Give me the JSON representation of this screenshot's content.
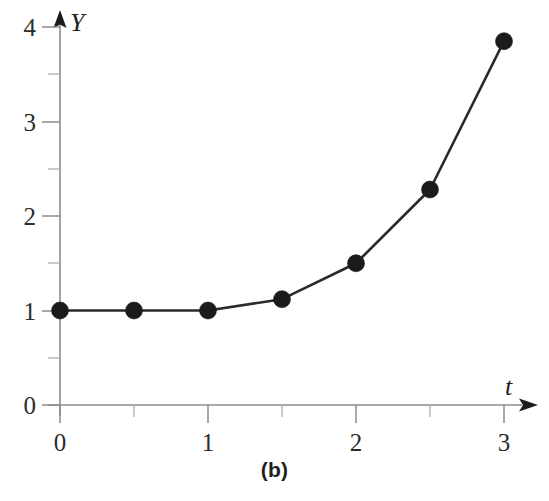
{
  "figure": {
    "caption": "(b)",
    "background_color": "#ffffff",
    "axis_color": "#8d8d8d",
    "line_color": "#2a2a2a",
    "marker_color": "#1b1b1b"
  },
  "chart_data": {
    "type": "line",
    "title": "",
    "subtitle": "",
    "caption": "(b)",
    "xlabel": "t",
    "ylabel": "Y",
    "xlim": [
      0,
      3
    ],
    "ylim": [
      0,
      4
    ],
    "grid": false,
    "legend": "none",
    "x": [
      0,
      0.5,
      1,
      1.5,
      2,
      2.5,
      3
    ],
    "y": [
      1.0,
      1.0,
      1.0,
      1.12,
      1.5,
      2.28,
      3.85
    ],
    "series": [
      {
        "name": "Y",
        "x": [
          0,
          0.5,
          1,
          1.5,
          2,
          2.5,
          3
        ],
        "values": [
          1.0,
          1.0,
          1.0,
          1.12,
          1.5,
          2.28,
          3.85
        ],
        "marker": "filled-circle",
        "marker_size": 9
      }
    ],
    "x_ticks_major": [
      0,
      1,
      2,
      3
    ],
    "x_tick_labels": [
      "0",
      "1",
      "2",
      "3"
    ],
    "x_ticks_minor": [
      0.5,
      1.5,
      2.5
    ],
    "y_ticks_major": [
      0,
      1,
      2,
      3,
      4
    ],
    "y_tick_labels": [
      "0",
      "1",
      "2",
      "3",
      "4"
    ],
    "y_ticks_minor": [
      0.5,
      1.5,
      2.5,
      3.5
    ],
    "x_axis_arrow": true,
    "y_axis_arrow": true
  },
  "axis_labels": {
    "y_axis_name": "Y",
    "x_axis_name": "t"
  },
  "y_tick_labels": [
    {
      "value": 4,
      "text": "4"
    },
    {
      "value": 3,
      "text": "3"
    },
    {
      "value": 2,
      "text": "2"
    },
    {
      "value": 1,
      "text": "1"
    },
    {
      "value": 0,
      "text": "0"
    }
  ],
  "x_tick_labels": [
    {
      "value": 0,
      "text": "0"
    },
    {
      "value": 1,
      "text": "1"
    },
    {
      "value": 2,
      "text": "2"
    },
    {
      "value": 3,
      "text": "3"
    }
  ]
}
